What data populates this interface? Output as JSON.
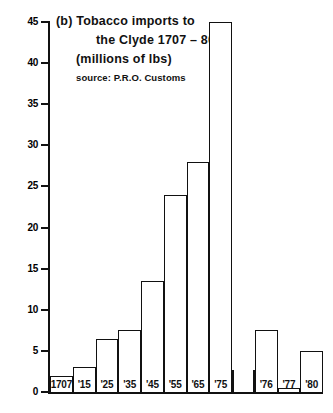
{
  "figure": {
    "panel_label": "(b)",
    "title_lines": [
      "(b) Tobacco  imports  to",
      "the Clyde 1707 – 80",
      "(millions of lbs)"
    ],
    "source": "source: P.R.O. Customs"
  },
  "chart_data": {
    "type": "bar",
    "subtitle": "source: P.R.O. Customs",
    "xlabel": "",
    "ylabel": "millions of lbs",
    "ylim": [
      0,
      45
    ],
    "ytick_values": [
      0,
      5,
      10,
      15,
      20,
      25,
      30,
      35,
      40,
      45
    ],
    "ytick_labels": [
      "0",
      "5",
      "10",
      "15",
      "20",
      "25",
      "30",
      "35",
      "40",
      "45"
    ],
    "grid": false,
    "legend": null,
    "categories": [
      "1707",
      "'15",
      "'25",
      "'35",
      "'45",
      "'55",
      "'65",
      "'75",
      "",
      "'76",
      "'77",
      "'80"
    ],
    "values": [
      2,
      3,
      6.5,
      7.5,
      13.5,
      24,
      28,
      45,
      null,
      7.5,
      0.5,
      5
    ]
  },
  "colors": {
    "ink": "#111111",
    "background": "#ffffff",
    "bar_fill": "#ffffff",
    "bar_stroke": "#111111"
  }
}
